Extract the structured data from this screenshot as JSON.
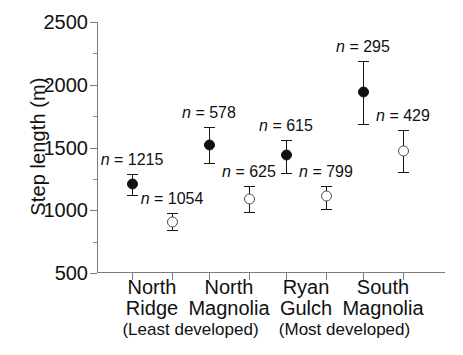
{
  "chart_data": {
    "type": "scatter",
    "title": "",
    "xlabel": "",
    "ylabel": "Step length (m)",
    "ylim": [
      500,
      2500
    ],
    "yticks": [
      500,
      1000,
      1500,
      2000,
      2500
    ],
    "ytick_labels": [
      "500",
      "1000",
      "1500",
      "2000",
      "2500"
    ],
    "yminor_ticks": [
      750,
      1250,
      1750,
      2250
    ],
    "grid": false,
    "legend": "none",
    "categories": [
      "North Ridge",
      "North Magnolia",
      "Ryan Gulch",
      "South Magnolia"
    ],
    "category_lines": [
      [
        "North",
        "Ridge"
      ],
      [
        "North",
        "Magnolia"
      ],
      [
        "Ryan",
        "Gulch"
      ],
      [
        "South",
        "Magnolia"
      ]
    ],
    "annotations": [
      {
        "text": "(Least developed)",
        "spans": [
          "North Ridge",
          "North Magnolia"
        ]
      },
      {
        "text": "(Most developed)",
        "spans": [
          "Ryan Gulch",
          "South Magnolia"
        ]
      }
    ],
    "series": [
      {
        "name": "filled",
        "marker": "filled-circle",
        "values": [
          1210,
          1520,
          1440,
          1945
        ],
        "err_low": [
          1120,
          1380,
          1300,
          1690
        ],
        "err_high": [
          1290,
          1665,
          1560,
          2190
        ],
        "n": [
          1215,
          578,
          615,
          295
        ],
        "n_labels": [
          "n = 1215",
          "n = 578",
          "n = 615",
          "n = 295"
        ]
      },
      {
        "name": "open",
        "marker": "open-circle",
        "values": [
          910,
          1090,
          1110,
          1470
        ],
        "err_low": [
          845,
          985,
          1010,
          1305
        ],
        "err_high": [
          975,
          1190,
          1195,
          1640
        ],
        "n": [
          1054,
          625,
          799,
          429
        ],
        "n_labels": [
          "n = 1054",
          "n = 625",
          "n = 799",
          "n = 429"
        ]
      }
    ]
  },
  "colors": {
    "filled_marker": "#111111",
    "open_marker_fill": "#ffffff",
    "open_marker_edge": "#4a4a4a",
    "axis": "#7b7b7b",
    "text": "#111111",
    "background": "#ffffff"
  }
}
